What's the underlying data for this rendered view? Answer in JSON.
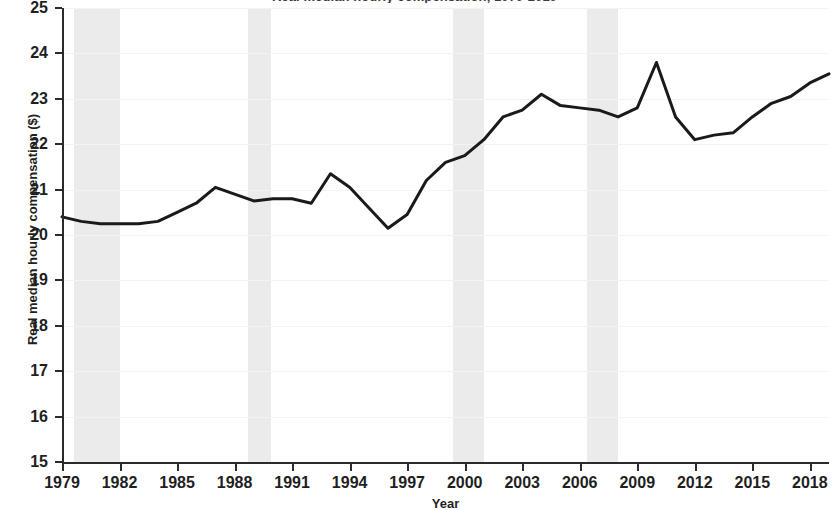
{
  "chart_data": {
    "type": "line",
    "title": "Real median hourly compensation, 1979-2019",
    "xlabel": "Year",
    "ylabel": "Real median hourly compensation ($)",
    "xlim": [
      1979,
      2019
    ],
    "ylim": [
      15,
      25
    ],
    "ytick_labels": [
      "25",
      "24",
      "23",
      "22",
      "21",
      "20",
      "19",
      "18",
      "17",
      "16",
      "15"
    ],
    "ytick_values": [
      25,
      24,
      23,
      22,
      21,
      20,
      19,
      18,
      17,
      16,
      15
    ],
    "xtick_labels": [
      "1979",
      "1982",
      "1985",
      "1988",
      "1991",
      "1994",
      "1997",
      "2000",
      "2003",
      "2006",
      "2009",
      "2012",
      "2015",
      "2018"
    ],
    "xtick_values": [
      1979,
      1982,
      1985,
      1988,
      1991,
      1994,
      1997,
      2000,
      2003,
      2006,
      2009,
      2012,
      2015,
      2018
    ],
    "grid": true,
    "legend": "none",
    "line_color": "#1a1a1a",
    "recession_band_color": "#ebebeb",
    "series": [
      {
        "name": "Real median hourly compensation ($)",
        "x": [
          1979,
          1980,
          1981,
          1982,
          1983,
          1984,
          1985,
          1986,
          1987,
          1988,
          1989,
          1990,
          1991,
          1992,
          1993,
          1994,
          1995,
          1996,
          1997,
          1998,
          1999,
          2000,
          2001,
          2002,
          2003,
          2004,
          2005,
          2006,
          2007,
          2008,
          2009,
          2010,
          2011,
          2012,
          2013,
          2014,
          2015,
          2016,
          2017,
          2018,
          2019
        ],
        "values": [
          20.4,
          20.3,
          20.25,
          20.25,
          20.25,
          20.3,
          20.5,
          20.7,
          21.05,
          20.9,
          20.75,
          20.8,
          20.8,
          20.7,
          21.35,
          21.05,
          20.6,
          20.15,
          20.45,
          21.2,
          21.6,
          21.75,
          22.1,
          22.6,
          22.75,
          23.1,
          22.85,
          22.8,
          22.75,
          22.6,
          22.8,
          23.8,
          22.6,
          22.1,
          22.2,
          22.25,
          22.6,
          22.9,
          23.05,
          23.35,
          23.55
        ]
      }
    ],
    "recession_bands": [
      {
        "start": 1979.6,
        "end": 1982.05,
        "label": "recession-1980-1982"
      },
      {
        "start": 1988.7,
        "end": 1989.9,
        "label": "recession-1990-1991"
      },
      {
        "start": 1999.4,
        "end": 2001.0,
        "label": "recession-2001"
      },
      {
        "start": 2006.4,
        "end": 2008.0,
        "label": "recession-2007-2009"
      }
    ]
  }
}
